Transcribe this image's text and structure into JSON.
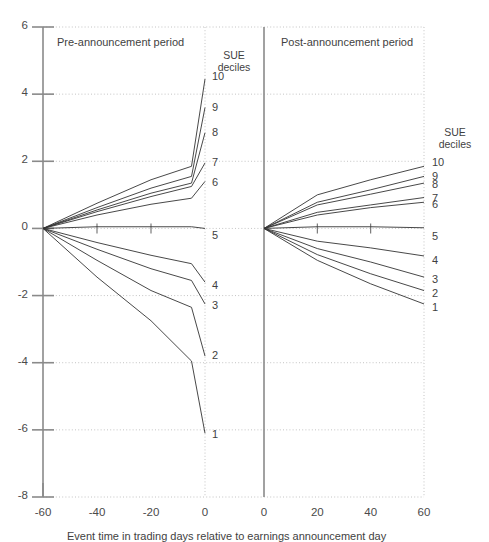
{
  "figure": {
    "x_axis_label": "Event time in trading days relative to earnings announcement day",
    "left_panel_title": "Pre-announcement period",
    "right_panel_title": "Post-announcement period",
    "sue_header_line1": "SUE",
    "sue_header_line2": "deciles",
    "y_ticks": [
      "6",
      "4",
      "2",
      "0",
      "-2",
      "-4",
      "-6",
      "-8"
    ],
    "x_ticks_left": [
      "-60",
      "-40",
      "-20",
      "0"
    ],
    "x_ticks_right": [
      "0",
      "20",
      "40",
      "60"
    ],
    "decile_labels": [
      "1",
      "2",
      "3",
      "4",
      "5",
      "6",
      "7",
      "8",
      "9",
      "10"
    ],
    "line_color": "#333333",
    "axis_color": "#8a8a8a",
    "grid_color": "#b5b5b5"
  },
  "chart_data": {
    "type": "line",
    "title": "",
    "xlabel": "Event time in trading days relative to earnings announcement day",
    "ylabel": "",
    "ylim": [
      -8,
      6
    ],
    "grid": true,
    "legend_position": "right-of-each-panel",
    "panels": [
      {
        "name": "Pre-announcement period",
        "xlim": [
          -60,
          0
        ],
        "x_ticks": [
          -60,
          -40,
          -20,
          0
        ],
        "x": [
          -60,
          -40,
          -20,
          -5,
          0
        ],
        "series": [
          {
            "name": "10",
            "values": [
              0.0,
              0.75,
              1.45,
              1.85,
              4.45
            ]
          },
          {
            "name": "9",
            "values": [
              0.0,
              0.62,
              1.2,
              1.55,
              3.6
            ]
          },
          {
            "name": "8",
            "values": [
              0.0,
              0.55,
              1.05,
              1.35,
              2.85
            ]
          },
          {
            "name": "7",
            "values": [
              0.0,
              0.5,
              0.95,
              1.25,
              1.95
            ]
          },
          {
            "name": "6",
            "values": [
              0.0,
              0.4,
              0.72,
              0.9,
              1.4
            ]
          },
          {
            "name": "5",
            "values": [
              0.0,
              0.05,
              0.05,
              0.05,
              0.0
            ]
          },
          {
            "name": "4",
            "values": [
              0.0,
              -0.42,
              -0.8,
              -1.05,
              -1.6
            ]
          },
          {
            "name": "3",
            "values": [
              0.0,
              -0.62,
              -1.2,
              -1.55,
              -2.25
            ]
          },
          {
            "name": "2",
            "values": [
              0.0,
              -0.95,
              -1.85,
              -2.35,
              -3.8
            ]
          },
          {
            "name": "1",
            "values": [
              0.0,
              -1.45,
              -2.75,
              -3.95,
              -6.1
            ]
          }
        ]
      },
      {
        "name": "Post-announcement period",
        "xlim": [
          0,
          60
        ],
        "x_ticks": [
          0,
          20,
          40,
          60
        ],
        "x": [
          0,
          20,
          40,
          60
        ],
        "series": [
          {
            "name": "10",
            "values": [
              0.0,
              1.0,
              1.45,
              1.85
            ]
          },
          {
            "name": "9",
            "values": [
              0.0,
              0.78,
              1.15,
              1.55
            ]
          },
          {
            "name": "8",
            "values": [
              0.0,
              0.7,
              1.02,
              1.35
            ]
          },
          {
            "name": "7",
            "values": [
              0.0,
              0.48,
              0.7,
              0.92
            ]
          },
          {
            "name": "6",
            "values": [
              0.0,
              0.4,
              0.62,
              0.78
            ]
          },
          {
            "name": "5",
            "values": [
              0.0,
              0.05,
              0.05,
              0.02
            ]
          },
          {
            "name": "4",
            "values": [
              0.0,
              -0.38,
              -0.58,
              -0.82
            ]
          },
          {
            "name": "3",
            "values": [
              0.0,
              -0.6,
              -1.0,
              -1.45
            ]
          },
          {
            "name": "2",
            "values": [
              0.0,
              -0.78,
              -1.35,
              -1.85
            ]
          },
          {
            "name": "1",
            "values": [
              0.0,
              -0.95,
              -1.65,
              -2.25
            ]
          }
        ]
      }
    ]
  }
}
